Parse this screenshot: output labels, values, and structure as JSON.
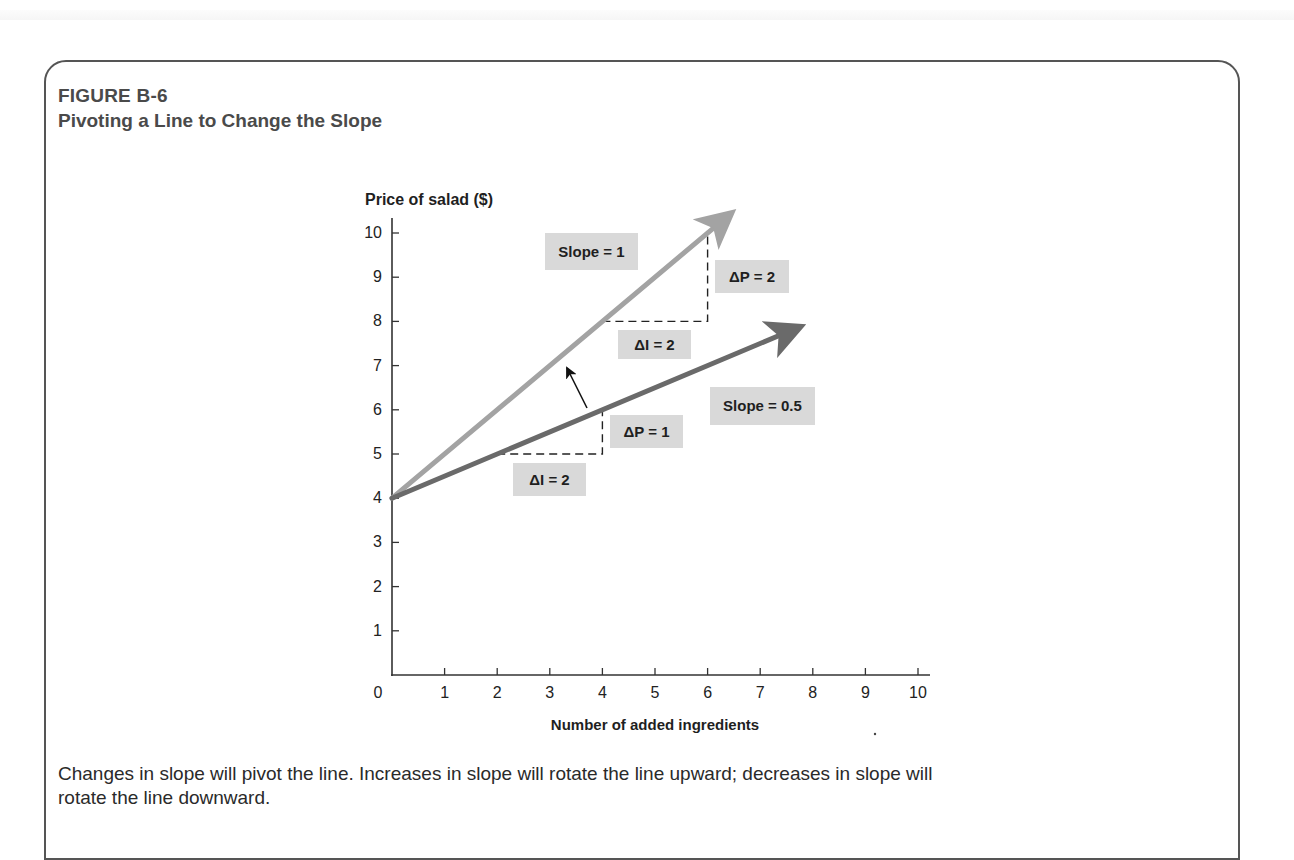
{
  "figure": {
    "label": "FIGURE B-6",
    "title": "Pivoting a Line to Change the Slope",
    "caption": "Changes in slope will pivot the line. Increases in slope will rotate the line upward; decreases in slope will rotate the line downward."
  },
  "chart_data": {
    "type": "line",
    "title": "Pivoting a Line to Change the Slope",
    "xlabel": "Number of added ingredients",
    "ylabel": "Price of salad ($)",
    "xlim": [
      0,
      10
    ],
    "ylim": [
      0,
      10
    ],
    "x_ticks": [
      0,
      1,
      2,
      3,
      4,
      5,
      6,
      7,
      8,
      9,
      10
    ],
    "y_ticks": [
      1,
      2,
      3,
      4,
      5,
      6,
      7,
      8,
      9,
      10
    ],
    "grid": false,
    "series": [
      {
        "name": "Slope = 1",
        "color": "#a3a3a3",
        "slope": 1,
        "intercept": 4,
        "points": [
          [
            0,
            4
          ],
          [
            6.4,
            10.4
          ]
        ],
        "arrow_end": true
      },
      {
        "name": "Slope = 0.5",
        "color": "#6a6a6a",
        "slope": 0.5,
        "intercept": 4,
        "points": [
          [
            0,
            4
          ],
          [
            7.7,
            7.85
          ]
        ],
        "arrow_end": true
      }
    ],
    "annotations": [
      {
        "text": "Slope = 1",
        "box": [
          545,
          233,
          93,
          37
        ],
        "fill": "#d9d9d9"
      },
      {
        "text": "ΔP = 2",
        "box": [
          715,
          260,
          74,
          33
        ],
        "fill": "#d9d9d9"
      },
      {
        "text": "ΔI = 2",
        "box": [
          618,
          330,
          73,
          29
        ],
        "fill": "#d9d9d9"
      },
      {
        "text": "Slope = 0.5",
        "box": [
          710,
          387,
          105,
          38
        ],
        "fill": "#d9d9d9"
      },
      {
        "text": "ΔP = 1",
        "box": [
          610,
          415,
          73,
          33
        ],
        "fill": "#d9d9d9"
      },
      {
        "text": "ΔI = 2",
        "box": [
          513,
          463,
          73,
          33
        ],
        "fill": "#d9d9d9"
      }
    ],
    "rise_run_guides": [
      {
        "from": [
          4,
          8
        ],
        "corner": [
          6,
          8
        ],
        "to": [
          6,
          10
        ],
        "label_run": "ΔI = 2",
        "label_rise": "ΔP = 2"
      },
      {
        "from": [
          2,
          5
        ],
        "corner": [
          4,
          5
        ],
        "to": [
          4,
          6
        ],
        "label_run": "ΔI = 2",
        "label_rise": "ΔP = 1"
      }
    ],
    "pivot_arrow": {
      "from": [
        587,
        408
      ],
      "to": [
        567,
        368
      ],
      "meaning": "rotation upward"
    }
  }
}
